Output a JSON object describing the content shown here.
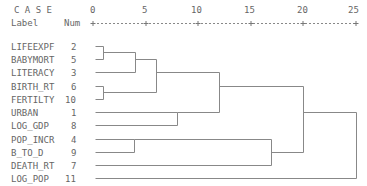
{
  "header": {
    "case_label": "C A S E",
    "label_col": "Label",
    "num_col": "Num"
  },
  "chart_data": {
    "type": "dendrogram",
    "title": "",
    "xlabel": "Rescaled Distance Cluster Combine",
    "axis_ticks": [
      "0",
      "5",
      "10",
      "15",
      "20",
      "25"
    ],
    "xlim": [
      0,
      25
    ],
    "leaves": [
      {
        "label": "LIFEEXPF",
        "num": "2"
      },
      {
        "label": "BABYMORT",
        "num": "5"
      },
      {
        "label": "LITERACY",
        "num": "3"
      },
      {
        "label": "BIRTH_RT",
        "num": "6"
      },
      {
        "label": "FERTILTY",
        "num": "10"
      },
      {
        "label": "URBAN",
        "num": "1"
      },
      {
        "label": "LOG_GDP",
        "num": "8"
      },
      {
        "label": "POP_INCR",
        "num": "4"
      },
      {
        "label": "B_TO_D",
        "num": "9"
      },
      {
        "label": "DEATH_RT",
        "num": "7"
      },
      {
        "label": "LOG_POP",
        "num": "11"
      }
    ],
    "merges": [
      {
        "a": "LIFEEXPF",
        "b": "BABYMORT",
        "distance": 1
      },
      {
        "a": "BIRTH_RT",
        "b": "FERTILTY",
        "distance": 1
      },
      {
        "a": "[LIFEEXPF,BABYMORT]",
        "b": "LITERACY",
        "distance": 4
      },
      {
        "a": "POP_INCR",
        "b": "B_TO_D",
        "distance": 4
      },
      {
        "a": "[LIFEEXPF,BABYMORT,LITERACY]",
        "b": "[BIRTH_RT,FERTILTY]",
        "distance": 6
      },
      {
        "a": "URBAN",
        "b": "LOG_GDP",
        "distance": 8
      },
      {
        "a": "[cluster 1-5]",
        "b": "[URBAN,LOG_GDP]",
        "distance": 12
      },
      {
        "a": "[POP_INCR,B_TO_D]",
        "b": "DEATH_RT",
        "distance": 17
      },
      {
        "a": "[cluster 1-7]",
        "b": "[POP_INCR,B_TO_D,DEATH_RT]",
        "distance": 20
      },
      {
        "a": "[cluster 1-10]",
        "b": "LOG_POP",
        "distance": 25
      }
    ]
  }
}
